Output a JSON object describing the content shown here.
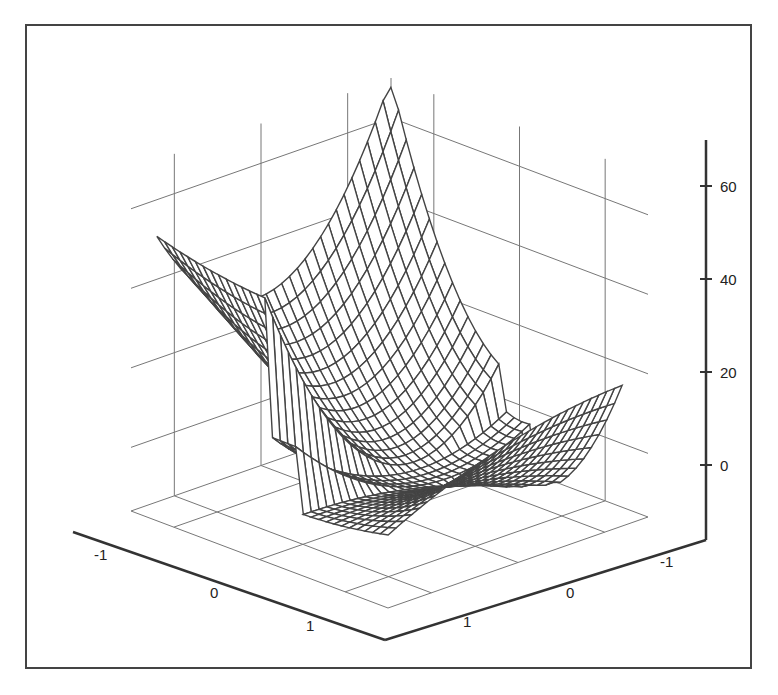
{
  "chart_data": {
    "type": "surface3d",
    "title": "",
    "xlabel": "",
    "ylabel": "",
    "zlabel": "",
    "x_ticks": [
      "-1",
      "0",
      "1"
    ],
    "y_ticks": [
      "-1",
      "0",
      "1"
    ],
    "z_ticks": [
      "0",
      "20",
      "40",
      "60"
    ],
    "xlim": [
      -1.5,
      1.5
    ],
    "ylim": [
      -1.5,
      1.5
    ],
    "zlim": [
      -16,
      70
    ],
    "grid": true,
    "mesh": {
      "rows": 30,
      "cols": 30
    },
    "colors": {
      "line": "#444444",
      "grid": "#777777",
      "axis": "#333333",
      "background": "#ffffff"
    }
  }
}
